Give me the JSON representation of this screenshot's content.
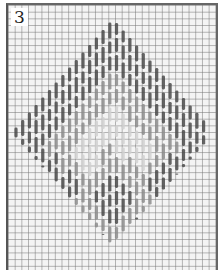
{
  "diagram": {
    "label": "3",
    "type": "bargello-stitch-chart",
    "grid": {
      "cell_px": 6.7,
      "line_color": "#8a8a8a",
      "background": "#f4f4f4"
    },
    "motif": {
      "shape": "diamond",
      "center_x": 113,
      "top_y": 25,
      "bottom_y": 242,
      "left_x": 16,
      "right_x": 210,
      "inner_light_center_y": 140,
      "outer_color": "#4a4a4a",
      "mid_color": "#8c8c8c",
      "inner_color": "#d0d0d0"
    },
    "frame_color": "#555555"
  }
}
